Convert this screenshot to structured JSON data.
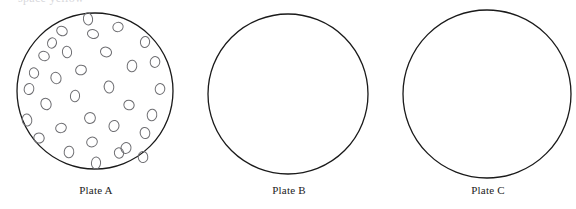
{
  "figure": {
    "type": "biology-diagram",
    "background_color": "#ffffff",
    "outline_color": "#1a1a1a",
    "colony_outline_color": "#6e6e72",
    "clipped_top_text": "space yellow",
    "label_font_size_px": 11
  },
  "plates": [
    {
      "id": "plate-a",
      "label": "Plate A",
      "label_center_x": 96,
      "label_top_y": 184,
      "circle": {
        "cx": 95,
        "cy": 91,
        "r": 78,
        "stroke_width": 1.3
      },
      "colony_count": 33,
      "colonies": [
        {
          "cx": 88,
          "cy": 19,
          "rx": 4.6,
          "ry": 6.0,
          "rot": -8
        },
        {
          "cx": 62,
          "cy": 31,
          "rx": 5.4,
          "ry": 4.6,
          "rot": 22
        },
        {
          "cx": 93,
          "cy": 34,
          "rx": 5.6,
          "ry": 4.4,
          "rot": 14
        },
        {
          "cx": 118,
          "cy": 27,
          "rx": 5.2,
          "ry": 4.6,
          "rot": -18
        },
        {
          "cx": 145,
          "cy": 42,
          "rx": 4.6,
          "ry": 5.6,
          "rot": 10
        },
        {
          "cx": 67,
          "cy": 52,
          "rx": 4.6,
          "ry": 5.8,
          "rot": -6
        },
        {
          "cx": 44,
          "cy": 56,
          "rx": 5.4,
          "ry": 4.6,
          "rot": 26
        },
        {
          "cx": 106,
          "cy": 52,
          "rx": 5.6,
          "ry": 4.8,
          "rot": 18
        },
        {
          "cx": 81,
          "cy": 70,
          "rx": 5.4,
          "ry": 4.8,
          "rot": -14
        },
        {
          "cx": 132,
          "cy": 66,
          "rx": 4.8,
          "ry": 5.8,
          "rot": 8
        },
        {
          "cx": 56,
          "cy": 78,
          "rx": 5.0,
          "ry": 5.8,
          "rot": -22
        },
        {
          "cx": 29,
          "cy": 89,
          "rx": 4.8,
          "ry": 5.6,
          "rot": 16
        },
        {
          "cx": 109,
          "cy": 87,
          "rx": 4.8,
          "ry": 6.0,
          "rot": -10
        },
        {
          "cx": 160,
          "cy": 89,
          "rx": 4.8,
          "ry": 5.4,
          "rot": 12
        },
        {
          "cx": 75,
          "cy": 96,
          "rx": 4.6,
          "ry": 5.8,
          "rot": 6
        },
        {
          "cx": 46,
          "cy": 104,
          "rx": 5.0,
          "ry": 5.8,
          "rot": -26
        },
        {
          "cx": 129,
          "cy": 105,
          "rx": 5.2,
          "ry": 4.8,
          "rot": 20
        },
        {
          "cx": 27,
          "cy": 120,
          "rx": 4.8,
          "ry": 6.0,
          "rot": -8
        },
        {
          "cx": 90,
          "cy": 118,
          "rx": 5.4,
          "ry": 5.4,
          "rot": 24
        },
        {
          "cx": 152,
          "cy": 115,
          "rx": 4.8,
          "ry": 5.8,
          "rot": 10
        },
        {
          "cx": 61,
          "cy": 128,
          "rx": 5.4,
          "ry": 4.6,
          "rot": -18
        },
        {
          "cx": 114,
          "cy": 126,
          "rx": 5.0,
          "ry": 5.6,
          "rot": 14
        },
        {
          "cx": 145,
          "cy": 133,
          "rx": 4.8,
          "ry": 5.6,
          "rot": -12
        },
        {
          "cx": 39,
          "cy": 138,
          "rx": 5.2,
          "ry": 5.0,
          "rot": 18
        },
        {
          "cx": 92,
          "cy": 142,
          "rx": 5.4,
          "ry": 4.8,
          "rot": -20
        },
        {
          "cx": 69,
          "cy": 152,
          "rx": 4.8,
          "ry": 5.8,
          "rot": 8
        },
        {
          "cx": 126,
          "cy": 148,
          "rx": 5.0,
          "ry": 5.4,
          "rot": 16
        },
        {
          "cx": 143,
          "cy": 157,
          "rx": 4.8,
          "ry": 5.6,
          "rot": -6
        },
        {
          "cx": 96,
          "cy": 163,
          "rx": 4.6,
          "ry": 6.0,
          "rot": 4
        },
        {
          "cx": 34,
          "cy": 73,
          "rx": 4.6,
          "ry": 5.2,
          "rot": -16
        },
        {
          "cx": 155,
          "cy": 62,
          "rx": 4.8,
          "ry": 5.4,
          "rot": 12
        },
        {
          "cx": 52,
          "cy": 43,
          "rx": 4.4,
          "ry": 5.2,
          "rot": 20
        },
        {
          "cx": 119,
          "cy": 153,
          "rx": 4.6,
          "ry": 5.2,
          "rot": -14
        }
      ]
    },
    {
      "id": "plate-b",
      "label": "Plate B",
      "label_center_x": 289,
      "label_top_y": 184,
      "circle": {
        "cx": 288,
        "cy": 94,
        "r": 80,
        "stroke_width": 1.3
      },
      "colony_count": 0,
      "colonies": []
    },
    {
      "id": "plate-c",
      "label": "Plate C",
      "label_center_x": 488,
      "label_top_y": 184,
      "circle": {
        "cx": 487,
        "cy": 94,
        "r": 84,
        "stroke_width": 1.3
      },
      "colony_count": 0,
      "colonies": []
    }
  ]
}
